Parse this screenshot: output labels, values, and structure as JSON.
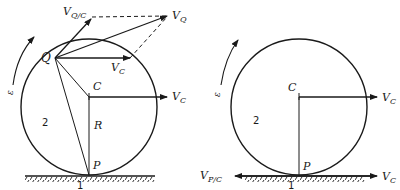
{
  "figure": {
    "colors": {
      "ink": "#1a1a1a",
      "background": "#ffffff"
    },
    "left_diagram": {
      "labels": {
        "v_qc": "V",
        "v_qc_sub": "Q/C",
        "v_q": "V",
        "v_q_sub": "Q",
        "q": "Q",
        "v_c_inner": "V",
        "v_c_inner_sub": "C",
        "c": "C",
        "v_c_outer": "V",
        "v_c_outer_sub": "C",
        "omega": "ε",
        "body": "2",
        "radius": "R",
        "contact": "P",
        "ground": "1"
      }
    },
    "right_diagram": {
      "labels": {
        "c": "C",
        "v_c": "V",
        "v_c_sub": "C",
        "omega": "ε",
        "body": "2",
        "contact": "P",
        "v_pc": "V",
        "v_pc_sub": "P/C",
        "v_c_ground": "V",
        "v_c_ground_sub": "C",
        "ground": "1"
      }
    }
  }
}
